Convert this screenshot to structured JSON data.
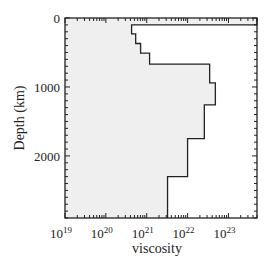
{
  "chart_data": {
    "type": "area",
    "title": "",
    "xlabel": "viscosity",
    "ylabel": "Depth (km)",
    "x_scale": "log",
    "xlim": [
      1e+19,
      5e+23
    ],
    "ylim": [
      2900,
      0
    ],
    "x_ticks": [
      {
        "value": 19,
        "base": "10",
        "exp": "19"
      },
      {
        "value": 20,
        "base": "10",
        "exp": "20"
      },
      {
        "value": 21,
        "base": "10",
        "exp": "21"
      },
      {
        "value": 22,
        "base": "10",
        "exp": "22"
      },
      {
        "value": 23,
        "base": "10",
        "exp": "23"
      }
    ],
    "y_ticks": [
      0,
      1000,
      2000
    ],
    "series": [
      {
        "name": "viscosity profile",
        "fill": "#efefef",
        "line": "#222222",
        "layers": [
          {
            "top_km": 0,
            "bottom_km": 100,
            "log10_viscosity": 23.7
          },
          {
            "top_km": 100,
            "bottom_km": 230,
            "log10_viscosity": 20.63
          },
          {
            "top_km": 230,
            "bottom_km": 370,
            "log10_viscosity": 20.73
          },
          {
            "top_km": 370,
            "bottom_km": 510,
            "log10_viscosity": 20.85
          },
          {
            "top_km": 510,
            "bottom_km": 670,
            "log10_viscosity": 21.07
          },
          {
            "top_km": 670,
            "bottom_km": 940,
            "log10_viscosity": 22.54
          },
          {
            "top_km": 940,
            "bottom_km": 1260,
            "log10_viscosity": 22.68
          },
          {
            "top_km": 1260,
            "bottom_km": 1750,
            "log10_viscosity": 22.41
          },
          {
            "top_km": 1750,
            "bottom_km": 2300,
            "log10_viscosity": 22.0
          },
          {
            "top_km": 2300,
            "bottom_km": 2900,
            "log10_viscosity": 21.51
          }
        ]
      }
    ],
    "grid": false,
    "legend": null
  }
}
